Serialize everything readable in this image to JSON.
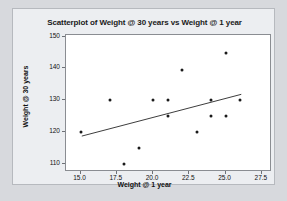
{
  "chart_data": {
    "type": "scatter",
    "title": "Scatterplot of Weight @ 30 years vs Weight @ 1 year",
    "xlabel": "Weight @ 1 year",
    "ylabel": "Weight @ 30 years",
    "xlim": [
      14.0,
      28.2
    ],
    "ylim": [
      107.5,
      150.5
    ],
    "xticks": [
      "15.0",
      "17.5",
      "20.0",
      "22.5",
      "25.0",
      "27.5"
    ],
    "xtick_values": [
      15.0,
      17.5,
      20.0,
      22.5,
      25.0,
      27.5
    ],
    "yticks": [
      "110",
      "120",
      "130",
      "140",
      "150"
    ],
    "ytick_values": [
      110,
      120,
      130,
      140,
      150
    ],
    "grid": false,
    "legend": false,
    "points": [
      {
        "x": 15.0,
        "y": 120.0
      },
      {
        "x": 17.0,
        "y": 130.0
      },
      {
        "x": 18.0,
        "y": 110.0
      },
      {
        "x": 19.0,
        "y": 115.0
      },
      {
        "x": 20.0,
        "y": 130.0
      },
      {
        "x": 21.0,
        "y": 130.0
      },
      {
        "x": 21.0,
        "y": 125.0
      },
      {
        "x": 22.0,
        "y": 139.5
      },
      {
        "x": 23.0,
        "y": 120.0
      },
      {
        "x": 24.0,
        "y": 130.0
      },
      {
        "x": 24.0,
        "y": 125.0
      },
      {
        "x": 25.0,
        "y": 145.0
      },
      {
        "x": 25.0,
        "y": 125.0
      },
      {
        "x": 26.0,
        "y": 130.0
      }
    ],
    "fit_line": {
      "x_start": 15.1,
      "y_start": 118.3,
      "x_end": 26.2,
      "y_end": 131.6,
      "color": "#3a3a3a"
    },
    "colors": {
      "point": "#1a1a1a",
      "frame": "#8a8d92",
      "panel_background": "#eceef1",
      "plot_background": "#ffffff",
      "outer_background": "#d7d9dd",
      "text": "#111111"
    }
  }
}
